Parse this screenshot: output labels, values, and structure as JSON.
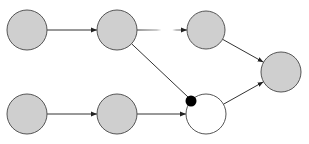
{
  "diagram": {
    "type": "directed-graph",
    "colors": {
      "node_fill_gray": "#cfcfcf",
      "node_fill_white": "#ffffff",
      "node_stroke": "#555555",
      "edge": "#333333",
      "marker": "#000000"
    },
    "nodes": [
      {
        "id": "n1",
        "cx": 27,
        "cy": 30,
        "r": 20,
        "fill": "gray"
      },
      {
        "id": "n2",
        "cx": 117,
        "cy": 30,
        "r": 20,
        "fill": "gray"
      },
      {
        "id": "n3",
        "cx": 206,
        "cy": 30,
        "r": 19,
        "fill": "gray"
      },
      {
        "id": "n4",
        "cx": 281,
        "cy": 72,
        "r": 20,
        "fill": "gray"
      },
      {
        "id": "n5",
        "cx": 27,
        "cy": 114,
        "r": 20,
        "fill": "gray"
      },
      {
        "id": "n6",
        "cx": 117,
        "cy": 114,
        "r": 20,
        "fill": "gray"
      },
      {
        "id": "n7",
        "cx": 206,
        "cy": 114,
        "r": 20,
        "fill": "white"
      }
    ],
    "edges": [
      {
        "from": "n1",
        "to": "n2",
        "style": "solid"
      },
      {
        "from": "n2",
        "to": "n3",
        "style": "faded-gap"
      },
      {
        "from": "n3",
        "to": "n4",
        "style": "solid"
      },
      {
        "from": "n5",
        "to": "n6",
        "style": "solid"
      },
      {
        "from": "n6",
        "to": "n7",
        "style": "solid"
      },
      {
        "from": "n7",
        "to": "n4",
        "style": "solid"
      },
      {
        "from": "n2",
        "to": "n7",
        "style": "solid",
        "head": "dot"
      }
    ],
    "markers": [
      {
        "id": "dot",
        "cx": 191,
        "cy": 101,
        "r": 5.5
      }
    ]
  }
}
